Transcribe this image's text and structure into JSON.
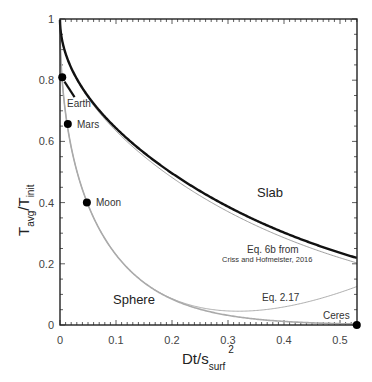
{
  "chart_data": {
    "type": "line",
    "title": "",
    "xlabel": "Dt/s_surf^2",
    "ylabel": "T_avg/T_init",
    "xlim": [
      0,
      0.53
    ],
    "ylim": [
      0,
      1
    ],
    "xticks": [
      "0",
      "0.1",
      "0.2",
      "0.3",
      "0.4",
      "0.5"
    ],
    "yticks": [
      "0",
      "0.2",
      "0.4",
      "0.6",
      "0.8",
      "1"
    ],
    "grid": false,
    "series": [
      {
        "name": "Slab",
        "style": "thick black",
        "color": "#111111"
      },
      {
        "name": "Eq. 6b from Criss and Hofmeister, 2016",
        "style": "thin gray",
        "color": "#888888"
      },
      {
        "name": "Sphere",
        "style": "medium gray",
        "color": "#aaaaaa"
      },
      {
        "name": "Eq. 2.17",
        "style": "thin gray",
        "color": "#999999"
      }
    ],
    "points": [
      {
        "label": "Earth",
        "x": 0.004,
        "y": 0.81
      },
      {
        "label": "Mars",
        "x": 0.014,
        "y": 0.657
      },
      {
        "label": "Moon",
        "x": 0.048,
        "y": 0.4
      },
      {
        "label": "Ceres",
        "x": 0.53,
        "y": 0.0
      }
    ],
    "annotations": {
      "slab": "Slab",
      "sphere": "Sphere",
      "eq6b_line1": "Eq. 6b from",
      "eq6b_line2": "Criss and Hofmeister, 2016",
      "eq217": "Eq. 2.17"
    }
  },
  "axis": {
    "y_main": "T",
    "y_sub1": "avg",
    "y_slash": "/T",
    "y_sub2": "init",
    "x_main": "Dt/s",
    "x_sub": "surf",
    "x_sup": "2"
  }
}
